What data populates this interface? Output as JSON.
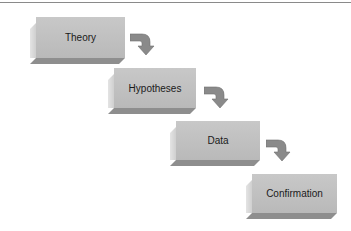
{
  "diagram": {
    "type": "staircase-flow",
    "steps": [
      {
        "label": "Theory"
      },
      {
        "label": "Hypotheses"
      },
      {
        "label": "Data"
      },
      {
        "label": "Confirmation"
      }
    ],
    "connectors": [
      {
        "from": "Theory",
        "to": "Hypotheses",
        "icon": "curved-arrow-down-icon"
      },
      {
        "from": "Hypotheses",
        "to": "Data",
        "icon": "curved-arrow-down-icon"
      },
      {
        "from": "Data",
        "to": "Confirmation",
        "icon": "curved-arrow-down-icon"
      }
    ],
    "colors": {
      "face": "#bfbfbf",
      "bevel_dark": "#8e8e8e",
      "bevel_light": "#d8d8d8",
      "arrow": "#8a8a8a"
    }
  }
}
